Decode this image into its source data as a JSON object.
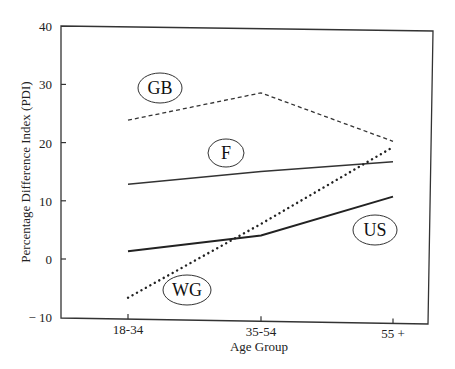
{
  "chart_data": {
    "type": "line",
    "title": "",
    "xlabel": "Age Group",
    "ylabel": "Percentage Difference Index (PDI)",
    "categories": [
      "18-34",
      "35-54",
      "55 +"
    ],
    "ylim": [
      -10,
      40
    ],
    "yticks": [
      -10,
      0,
      10,
      20,
      30,
      40
    ],
    "ytick_labels": [
      "− 10",
      "0",
      "10",
      "20",
      "30",
      "40"
    ],
    "grid": false,
    "legend": "inline ellipse labels",
    "series": [
      {
        "name": "GB",
        "style": "dashed",
        "values": [
          24,
          29,
          21
        ]
      },
      {
        "name": "F",
        "style": "solid-thin",
        "values": [
          13,
          15.5,
          17.5
        ]
      },
      {
        "name": "US",
        "style": "solid-thick",
        "values": [
          1.5,
          4.5,
          11.5
        ]
      },
      {
        "name": "WG",
        "style": "dotted",
        "values": [
          -6.5,
          6.5,
          20
        ]
      }
    ]
  }
}
